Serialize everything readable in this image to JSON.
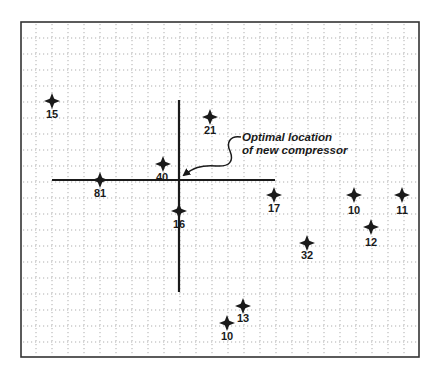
{
  "diagram": {
    "title": "",
    "frame": {
      "x": 21,
      "y": 22,
      "width": 398,
      "height": 335
    },
    "grid": {
      "spacing": 16,
      "origin_x": 36,
      "origin_y": 38,
      "color": "#9a9a9a",
      "style": "dotted"
    },
    "colors": {
      "ink": "#1a1a1a",
      "frame": "#333333",
      "background": "#ffffff"
    },
    "axes": {
      "center": {
        "x": 179,
        "y": 180
      },
      "horizontal": {
        "x1": 52,
        "x2": 275,
        "y": 180
      },
      "vertical": {
        "x": 179,
        "y1": 100,
        "y2": 292
      }
    },
    "points": [
      {
        "id": "p15",
        "label": "15",
        "x": 52,
        "y": 101,
        "label_dx": 0,
        "label_dy": 17,
        "anchor": "middle"
      },
      {
        "id": "p21",
        "label": "21",
        "x": 210,
        "y": 117,
        "label_dx": 0,
        "label_dy": 17,
        "anchor": "middle"
      },
      {
        "id": "p40",
        "label": "40",
        "x": 163,
        "y": 164,
        "label_dx": -1,
        "label_dy": 17,
        "anchor": "middle"
      },
      {
        "id": "p81",
        "label": "81",
        "x": 100,
        "y": 180,
        "label_dx": 0,
        "label_dy": 17,
        "anchor": "middle"
      },
      {
        "id": "p16",
        "label": "16",
        "x": 179,
        "y": 211,
        "label_dx": 0,
        "label_dy": 17,
        "anchor": "middle"
      },
      {
        "id": "p17",
        "label": "17",
        "x": 274,
        "y": 195,
        "label_dx": 0,
        "label_dy": 17,
        "anchor": "middle"
      },
      {
        "id": "p10a",
        "label": "10",
        "x": 354,
        "y": 195,
        "label_dx": 0,
        "label_dy": 19,
        "anchor": "middle"
      },
      {
        "id": "p11",
        "label": "11",
        "x": 402,
        "y": 195,
        "label_dx": 0,
        "label_dy": 19,
        "anchor": "middle"
      },
      {
        "id": "p12",
        "label": "12",
        "x": 371,
        "y": 227,
        "label_dx": 0,
        "label_dy": 19,
        "anchor": "middle"
      },
      {
        "id": "p32",
        "label": "32",
        "x": 307,
        "y": 243,
        "label_dx": 0,
        "label_dy": 16,
        "anchor": "middle"
      },
      {
        "id": "p13",
        "label": "13",
        "x": 243,
        "y": 306,
        "label_dx": 0,
        "label_dy": 16,
        "anchor": "middle"
      },
      {
        "id": "p10b",
        "label": "10",
        "x": 227,
        "y": 323,
        "label_dx": 0,
        "label_dy": 17,
        "anchor": "middle"
      }
    ],
    "callout": {
      "line1": "Optimal location",
      "line2": "of new compressor",
      "text_x": 242,
      "text_y1": 141,
      "text_y2": 154,
      "arrow_target": {
        "x": 181,
        "y": 178
      }
    }
  }
}
